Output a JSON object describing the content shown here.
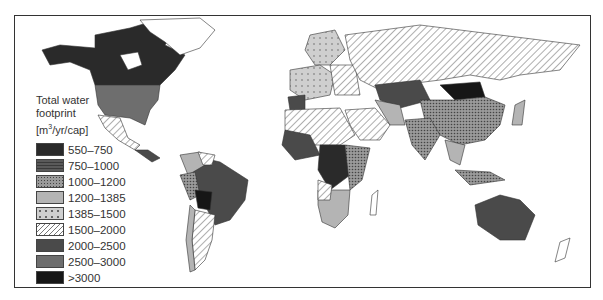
{
  "legend": {
    "title_line1": "Total water",
    "title_line2": "footprint",
    "unit_prefix": "[m",
    "unit_sup": "3",
    "unit_suffix": "/yr/cap]",
    "items": [
      {
        "label": "550–750",
        "fill": "#2a2a2a",
        "pattern": "solid"
      },
      {
        "label": "750–1000",
        "fill": "#555555",
        "pattern": "hlines"
      },
      {
        "label": "1000–1200",
        "fill": "#777777",
        "pattern": "dots-dense"
      },
      {
        "label": "1200–1385",
        "fill": "#b4b4b4",
        "pattern": "solid"
      },
      {
        "label": "1385–1500",
        "fill": "#cccccc",
        "pattern": "dots-sparse"
      },
      {
        "label": "1500–2000",
        "fill": "#ffffff",
        "pattern": "diagonal"
      },
      {
        "label": "2000–2500",
        "fill": "#4a4a4a",
        "pattern": "solid"
      },
      {
        "label": "2500–3000",
        "fill": "#6e6e6e",
        "pattern": "solid"
      },
      {
        "label": ">3000",
        "fill": "#161616",
        "pattern": "solid"
      }
    ]
  },
  "map": {
    "title": "World map of total water footprint per capita"
  }
}
